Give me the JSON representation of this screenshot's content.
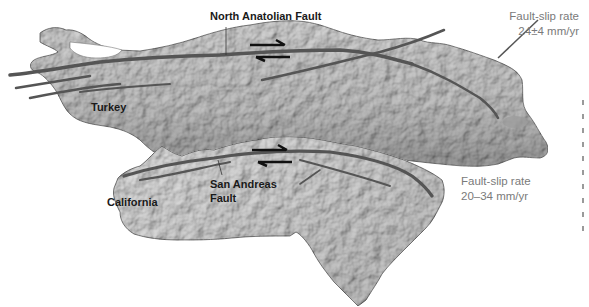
{
  "figure": {
    "colors": {
      "background": "#ffffff",
      "turkey_land": "#c9c9c9",
      "california_land": "#d6d6d6",
      "fault_line": "#555555",
      "arrow": "#111111",
      "label_text": "#1a1a1a",
      "rate_text": "#7a7a7a"
    }
  },
  "turkey": {
    "region_label": "Turkey",
    "fault_label": "North Anatolian Fault",
    "slip_rate": {
      "title": "Fault-slip rate",
      "value": "24±4 mm/yr"
    },
    "motion": "right-lateral"
  },
  "california": {
    "region_label": "California",
    "fault_label_line1": "San Andreas",
    "fault_label_line2": "Fault",
    "slip_rate": {
      "title": "Fault-slip rate",
      "value": "20–34 mm/yr"
    },
    "motion": "right-lateral"
  }
}
